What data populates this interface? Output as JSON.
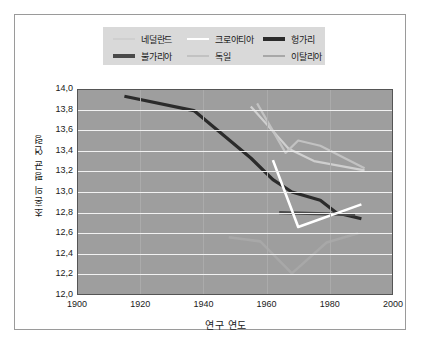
{
  "legend": {
    "entries": [
      {
        "label": "네덜란드",
        "color": "#cfcfcf",
        "width": 2,
        "col": 0,
        "row": 0
      },
      {
        "label": "불가리아",
        "color": "#4a4a4a",
        "width": 3.2,
        "col": 0,
        "row": 1
      },
      {
        "label": "크로아티아",
        "color": "#ffffff",
        "width": 2.6,
        "col": 1,
        "row": 0
      },
      {
        "label": "독일",
        "color": "#c2c2c2",
        "width": 2,
        "col": 1,
        "row": 1
      },
      {
        "label": "헝가리",
        "color": "#2b2b2b",
        "width": 3.2,
        "col": 2,
        "row": 0
      },
      {
        "label": "이탈리아",
        "color": "#a8a8a8",
        "width": 2.6,
        "col": 2,
        "row": 1
      }
    ]
  },
  "chart_data": {
    "type": "line",
    "title": "",
    "xlabel": "연구 연도",
    "ylabel": "초혼의 평균 연령",
    "xlim": [
      1900,
      2000
    ],
    "ylim": [
      12.0,
      14.0
    ],
    "xticks": [
      1900,
      1920,
      1940,
      1960,
      1980,
      2000
    ],
    "yticks": [
      "12,0",
      "12,2",
      "12,4",
      "12,6",
      "12,8",
      "13,0",
      "13,2",
      "13,4",
      "13,6",
      "13,8",
      "14,0"
    ],
    "ytick_values": [
      12.0,
      12.2,
      12.4,
      12.6,
      12.8,
      13.0,
      13.2,
      13.4,
      13.6,
      13.8,
      14.0
    ],
    "grid": true,
    "legend_position": "top",
    "plot_background": "#9e9e9e",
    "grid_color": "#f2f2f2",
    "series": [
      {
        "name": "헝가리",
        "color": "#2b2b2b",
        "width": 3.2,
        "points": [
          [
            1915,
            13.93
          ],
          [
            1937,
            13.79
          ],
          [
            1955,
            13.33
          ],
          [
            1962,
            13.12
          ],
          [
            1968,
            13.0
          ],
          [
            1977,
            12.92
          ],
          [
            1982,
            12.8
          ],
          [
            1990,
            12.74
          ]
        ]
      },
      {
        "name": "불가리아",
        "color": "#4a4a4a",
        "width": 3.2,
        "points": [
          [
            1964,
            12.8
          ],
          [
            1988,
            12.78
          ]
        ]
      },
      {
        "name": "크로아티아",
        "color": "#ffffff",
        "width": 2.6,
        "points": [
          [
            1962,
            13.31
          ],
          [
            1970,
            12.66
          ],
          [
            1990,
            12.88
          ]
        ]
      },
      {
        "name": "네덜란드",
        "color": "#cfcfcf",
        "width": 2.2,
        "points": [
          [
            1955,
            13.83
          ],
          [
            1967,
            13.42
          ],
          [
            1975,
            13.3
          ],
          [
            1991,
            13.21
          ]
        ]
      },
      {
        "name": "독일",
        "color": "#c2c2c2",
        "width": 2.2,
        "points": [
          [
            1957,
            13.86
          ],
          [
            1966,
            13.38
          ],
          [
            1970,
            13.5
          ],
          [
            1977,
            13.45
          ],
          [
            1991,
            13.23
          ]
        ]
      },
      {
        "name": "이탈리아",
        "color": "#a8a8a8",
        "width": 2.6,
        "points": [
          [
            1948,
            12.56
          ],
          [
            1958,
            12.52
          ],
          [
            1968,
            12.21
          ],
          [
            1979,
            12.51
          ],
          [
            1989,
            12.6
          ]
        ]
      }
    ]
  }
}
